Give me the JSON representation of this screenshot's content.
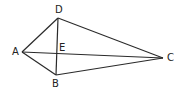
{
  "diagram": {
    "type": "kite",
    "points": {
      "A": {
        "label": "A",
        "x": 22,
        "y": 52
      },
      "B": {
        "label": "B",
        "x": 56,
        "y": 75
      },
      "C": {
        "label": "C",
        "x": 163,
        "y": 58
      },
      "D": {
        "label": "D",
        "x": 58,
        "y": 18
      },
      "E": {
        "label": "E",
        "x": 57,
        "y": 54
      }
    },
    "segments": [
      "AD",
      "DC",
      "CB",
      "BA",
      "AC",
      "DB"
    ],
    "stroke_color": "#2a2a2a"
  }
}
